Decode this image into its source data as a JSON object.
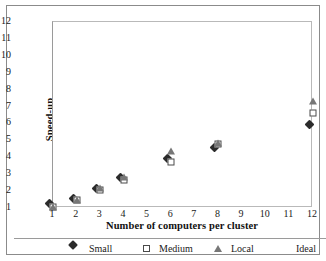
{
  "chart_data": {
    "type": "scatter",
    "title": "",
    "xlabel": "Number of computers per cluster",
    "ylabel": "Speed-up",
    "xlim": [
      1,
      12
    ],
    "ylim": [
      1,
      12
    ],
    "xticks": [
      "1",
      "2",
      "3",
      "4",
      "5",
      "6",
      "7",
      "8",
      "9",
      "10",
      "11",
      "12"
    ],
    "yticks": [
      "1",
      "2",
      "3",
      "4",
      "5",
      "6",
      "7",
      "8",
      "9",
      "10",
      "11",
      "12"
    ],
    "grid": false,
    "legend_position": "bottom",
    "series": [
      {
        "name": "Small",
        "marker": "filled-diamond",
        "color": "#2b2b2b",
        "x": [
          1,
          2,
          3,
          4,
          6,
          8,
          12
        ],
        "y": [
          1.05,
          1.35,
          1.95,
          2.6,
          3.7,
          4.35,
          5.75
        ]
      },
      {
        "name": "Medium",
        "marker": "open-square",
        "color": "#4a4a4a",
        "x": [
          1,
          2,
          3,
          4,
          6,
          8,
          12
        ],
        "y": [
          1.05,
          1.45,
          2.05,
          2.65,
          3.75,
          4.8,
          6.6
        ]
      },
      {
        "name": "Local",
        "marker": "triangle",
        "color": "#777777",
        "x": [
          1,
          2,
          3,
          4,
          6,
          8,
          12
        ],
        "y": [
          1.05,
          1.5,
          2.2,
          2.85,
          4.35,
          4.85,
          7.3
        ]
      },
      {
        "name": "Ideal",
        "marker": "none",
        "color": "#999999",
        "x": [],
        "y": []
      }
    ]
  },
  "legend": {
    "entries": [
      {
        "label": "Small",
        "marker": "filled-diamond"
      },
      {
        "label": "Medium",
        "marker": "open-square"
      },
      {
        "label": "Local",
        "marker": "triangle"
      },
      {
        "label": "Ideal",
        "marker": "none"
      }
    ]
  }
}
